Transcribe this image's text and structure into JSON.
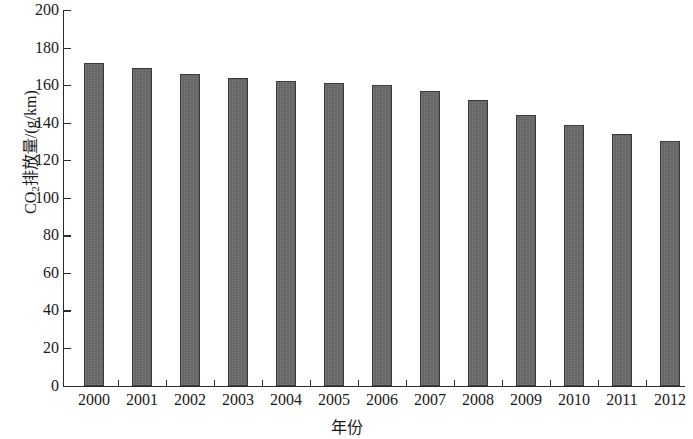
{
  "chart_data": {
    "type": "bar",
    "title": "",
    "xlabel": "年份",
    "ylabel_parts": {
      "prefix": "CO",
      "subscript": "2",
      "suffix": "排放量/(g/km)"
    },
    "ylabel": "CO2排放量/(g/km)",
    "categories": [
      "2000",
      "2001",
      "2002",
      "2003",
      "2004",
      "2005",
      "2006",
      "2007",
      "2008",
      "2009",
      "2010",
      "2011",
      "2012"
    ],
    "values": [
      172,
      169,
      166,
      164,
      162,
      161,
      160,
      157,
      152,
      144,
      139,
      134,
      130
    ],
    "ylim": [
      0,
      200
    ],
    "ytick_step": 20,
    "yticks": [
      "0",
      "20",
      "40",
      "60",
      "80",
      "100",
      "120",
      "140",
      "160",
      "180",
      "200"
    ],
    "grid": false,
    "legend": null,
    "bar_color": "#6b6b6b",
    "bar_edge_color": "#3a3a3a",
    "axis_color": "#2b2b2b",
    "background_color": "#ffffff"
  }
}
